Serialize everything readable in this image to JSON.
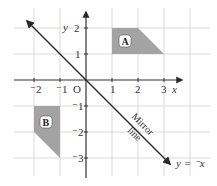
{
  "diagram": {
    "origin_label": "O",
    "x_axis_label": "x",
    "y_axis_label": "y",
    "x_ticks": [
      {
        "value": -2,
        "label": "⁻2"
      },
      {
        "value": -1,
        "label": "⁻1"
      },
      {
        "value": 1,
        "label": "1"
      },
      {
        "value": 2,
        "label": "2"
      },
      {
        "value": 3,
        "label": "3"
      }
    ],
    "y_ticks": [
      {
        "value": 2,
        "label": "2"
      },
      {
        "value": 1,
        "label": "1"
      },
      {
        "value": -1,
        "label": "⁻1"
      },
      {
        "value": -2,
        "label": "⁻2"
      },
      {
        "value": -3,
        "label": "⁻3"
      }
    ],
    "shapes": [
      {
        "name": "A",
        "vertices": [
          [
            1,
            1
          ],
          [
            1,
            2
          ],
          [
            2,
            2
          ],
          [
            3,
            1
          ]
        ],
        "fill": "#a3a3a3"
      },
      {
        "name": "B",
        "vertices": [
          [
            -2,
            -1
          ],
          [
            -1,
            -1
          ],
          [
            -1,
            -3
          ],
          [
            -2,
            -2
          ]
        ],
        "fill": "#a3a3a3"
      }
    ],
    "mirror_line": {
      "equation": "y = ⁻x",
      "label_line1": "Mirror",
      "label_line2": "line"
    },
    "grid": {
      "x_range": [
        -3,
        4
      ],
      "y_range": [
        -4,
        3
      ],
      "visible": true
    }
  }
}
